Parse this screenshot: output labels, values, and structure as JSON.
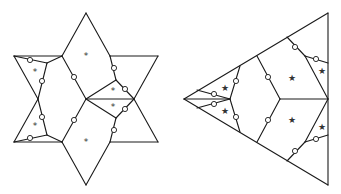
{
  "figure": {
    "width": 341,
    "height": 194,
    "colors": {
      "line": "#1a1a1a",
      "background": "#ffffff",
      "mark": "#333333"
    }
  },
  "left_diagram": {
    "shape": "six-pointed star (hexagram) partitioned into regions",
    "marker_glyph": "*",
    "edges": [
      [
        86,
        13,
        62,
        56
      ],
      [
        86,
        13,
        110,
        56
      ],
      [
        14,
        56,
        62,
        56
      ],
      [
        110,
        56,
        158,
        56
      ],
      [
        14,
        56,
        38,
        99
      ],
      [
        158,
        56,
        134,
        99
      ],
      [
        14,
        142,
        38,
        99
      ],
      [
        158,
        142,
        134,
        99
      ],
      [
        14,
        142,
        62,
        142
      ],
      [
        110,
        142,
        158,
        142
      ],
      [
        86,
        185,
        62,
        142
      ],
      [
        86,
        185,
        110,
        142
      ],
      [
        62,
        56,
        86,
        99
      ],
      [
        86,
        99,
        62,
        142
      ],
      [
        86,
        99,
        134,
        99
      ],
      [
        86,
        99,
        116,
        80
      ],
      [
        86,
        99,
        116,
        118
      ],
      [
        116,
        80,
        110,
        56
      ],
      [
        116,
        118,
        110,
        142
      ],
      [
        116,
        80,
        134,
        99
      ],
      [
        116,
        118,
        134,
        99
      ],
      [
        14,
        56,
        47,
        63
      ],
      [
        47,
        63,
        62,
        56
      ],
      [
        47,
        63,
        38,
        99
      ],
      [
        14,
        142,
        47,
        135
      ],
      [
        47,
        135,
        62,
        142
      ],
      [
        47,
        135,
        38,
        99
      ]
    ],
    "nodes": [
      [
        30,
        60
      ],
      [
        42,
        81
      ],
      [
        30,
        138
      ],
      [
        42,
        117
      ],
      [
        74,
        77
      ],
      [
        74,
        120
      ],
      [
        114,
        68
      ],
      [
        125,
        89
      ],
      [
        125,
        109
      ],
      [
        114,
        130
      ]
    ],
    "marks": [
      {
        "x": 86,
        "y": 56,
        "label": "*"
      },
      {
        "x": 35,
        "y": 72,
        "label": "*"
      },
      {
        "x": 35,
        "y": 126,
        "label": "*"
      },
      {
        "x": 113,
        "y": 91,
        "label": "*"
      },
      {
        "x": 113,
        "y": 107,
        "label": "*"
      },
      {
        "x": 86,
        "y": 142,
        "label": "*"
      }
    ]
  },
  "right_diagram": {
    "shape": "triangle partitioned into regions",
    "marker_glyph": "★",
    "edges": [
      [
        184,
        99,
        328,
        13
      ],
      [
        184,
        99,
        328,
        185
      ],
      [
        328,
        13,
        328,
        185
      ],
      [
        257,
        56,
        280,
        99
      ],
      [
        280,
        99,
        257,
        142
      ],
      [
        280,
        99,
        328,
        99
      ],
      [
        287,
        37,
        305,
        56
      ],
      [
        305,
        56,
        328,
        99
      ],
      [
        287,
        161,
        305,
        142
      ],
      [
        305,
        142,
        328,
        99
      ],
      [
        305,
        56,
        328,
        63
      ],
      [
        305,
        142,
        328,
        135
      ],
      [
        240,
        66,
        230,
        99
      ],
      [
        230,
        99,
        240,
        132
      ],
      [
        230,
        99,
        184,
        99
      ],
      [
        197,
        90,
        230,
        99
      ],
      [
        197,
        108,
        230,
        99
      ]
    ],
    "nodes": [
      [
        268,
        77
      ],
      [
        268,
        120
      ],
      [
        295,
        47
      ],
      [
        316,
        59
      ],
      [
        295,
        151
      ],
      [
        316,
        139
      ],
      [
        236,
        81
      ],
      [
        236,
        117
      ],
      [
        214,
        94
      ],
      [
        214,
        104
      ]
    ],
    "marks": [
      {
        "x": 292,
        "y": 78,
        "label": "★"
      },
      {
        "x": 292,
        "y": 120,
        "label": "★"
      },
      {
        "x": 322,
        "y": 71,
        "label": "★"
      },
      {
        "x": 322,
        "y": 127,
        "label": "★"
      },
      {
        "x": 225,
        "y": 88,
        "label": "★"
      },
      {
        "x": 225,
        "y": 111,
        "label": "★"
      }
    ]
  }
}
